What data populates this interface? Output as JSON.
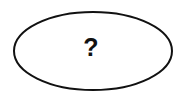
{
  "diagram": {
    "shapes": [
      {
        "type": "ellipse",
        "label": "?",
        "cx": 93,
        "cy": 51,
        "rx": 79,
        "ry": 39,
        "stroke": "#111111",
        "fill": "#ffffff"
      }
    ]
  }
}
